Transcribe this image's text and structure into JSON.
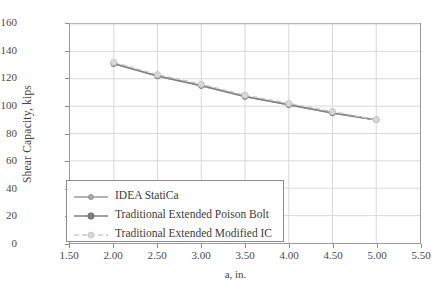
{
  "chart_data": {
    "type": "line",
    "title": "",
    "xlabel": "a, in.",
    "ylabel": "Shear Capacity, kips",
    "xlim": [
      1.5,
      5.5
    ],
    "ylim": [
      0,
      160
    ],
    "xticks": [
      "1.50",
      "2.00",
      "2.50",
      "3.00",
      "3.50",
      "4.00",
      "4.50",
      "5.00",
      "5.50"
    ],
    "yticks": [
      "0",
      "20",
      "40",
      "60",
      "80",
      "100",
      "120",
      "140",
      "160"
    ],
    "grid": true,
    "legend_position": "lower-left-inside",
    "x": [
      2.0,
      2.5,
      3.0,
      3.5,
      4.0,
      4.5,
      5.0
    ],
    "series": [
      {
        "name": "IDEA StatiCa",
        "color": "#9a9a9a",
        "line_style": "solid",
        "marker": "circle-small",
        "values": [
          131,
          122,
          115,
          107,
          101,
          95,
          90
        ]
      },
      {
        "name": "Traditional Extended Poison Bolt",
        "color": "#808080",
        "line_style": "solid",
        "marker": "circle-filled",
        "values": [
          131,
          122,
          115,
          107,
          101,
          95,
          90
        ]
      },
      {
        "name": "Traditional Extended Modified IC",
        "color": "#c4c4c4",
        "line_style": "dashed",
        "marker": "circle-light",
        "values": [
          132,
          123,
          116,
          108,
          102,
          96,
          90
        ]
      }
    ]
  },
  "colors": {
    "axis": "#9b9b9b",
    "grid": "#d9d9d9",
    "text": "#3a3a3a",
    "background": "#ffffff"
  }
}
